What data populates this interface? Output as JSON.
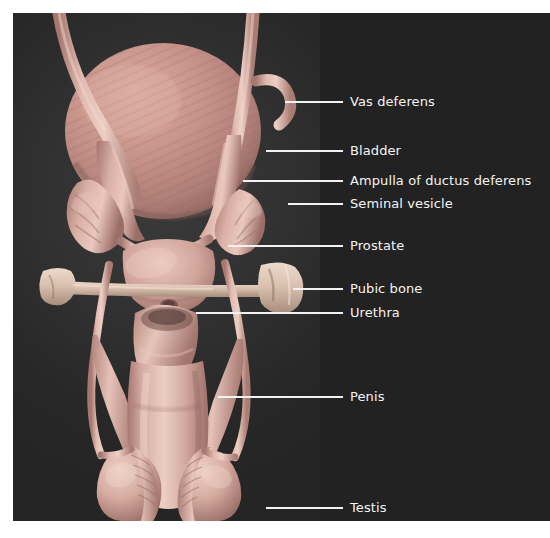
{
  "figure": {
    "background_color": "#ffffff",
    "panel_color": "#232323",
    "stage_color": "#303030",
    "label_panel_color": "#212121",
    "label_text_color": "#f4f4f4",
    "leader_line_color": "#f2f2f2",
    "organ_color": "#c79a92",
    "organ_highlight_color": "#e8c4bb",
    "organ_shadow_color": "#8d645e",
    "bone_color": "#d9c3b4"
  },
  "labels": [
    {
      "id": "vas-deferens",
      "text": "Vas deferens",
      "leader": {
        "x": 272,
        "y": 88,
        "width": 58
      },
      "text_x": 337,
      "text_y": 81
    },
    {
      "id": "bladder",
      "text": "Bladder",
      "leader": {
        "x": 253,
        "y": 137,
        "width": 77
      },
      "text_x": 337,
      "text_y": 130
    },
    {
      "id": "ampulla-of-ductus-deferens",
      "text": "Ampulla of ductus deferens",
      "leader": {
        "x": 230,
        "y": 167,
        "width": 100
      },
      "text_x": 337,
      "text_y": 160
    },
    {
      "id": "seminal-vesicle",
      "text": "Seminal vesicle",
      "leader": {
        "x": 275,
        "y": 190,
        "width": 55
      },
      "text_x": 337,
      "text_y": 183
    },
    {
      "id": "prostate",
      "text": "Prostate",
      "leader": {
        "x": 215,
        "y": 232,
        "width": 115
      },
      "text_x": 337,
      "text_y": 225
    },
    {
      "id": "pubic-bone",
      "text": "Pubic bone",
      "leader": {
        "x": 280,
        "y": 275,
        "width": 50
      },
      "text_x": 337,
      "text_y": 268
    },
    {
      "id": "urethra",
      "text": "Urethra",
      "leader": {
        "x": 183,
        "y": 299,
        "width": 147
      },
      "text_x": 337,
      "text_y": 292
    },
    {
      "id": "penis",
      "text": "Penis",
      "leader": {
        "x": 205,
        "y": 383,
        "width": 125
      },
      "text_x": 337,
      "text_y": 376
    },
    {
      "id": "testis",
      "text": "Testis",
      "leader": {
        "x": 253,
        "y": 494,
        "width": 77
      },
      "text_x": 337,
      "text_y": 487
    }
  ],
  "structures": [
    {
      "id": "bladder",
      "name": "Bladder"
    },
    {
      "id": "vas-deferens-left",
      "name": "Vas deferens (left)"
    },
    {
      "id": "vas-deferens-right",
      "name": "Vas deferens (right)"
    },
    {
      "id": "ampulla-left",
      "name": "Ampulla of ductus deferens (left)"
    },
    {
      "id": "ampulla-right",
      "name": "Ampulla of ductus deferens (right)"
    },
    {
      "id": "seminal-vesicle-left",
      "name": "Seminal vesicle (left)"
    },
    {
      "id": "seminal-vesicle-right",
      "name": "Seminal vesicle (right)"
    },
    {
      "id": "prostate",
      "name": "Prostate"
    },
    {
      "id": "pubic-bone",
      "name": "Pubic bone"
    },
    {
      "id": "urethra",
      "name": "Urethra"
    },
    {
      "id": "penis-shaft",
      "name": "Penis shaft"
    },
    {
      "id": "corpus-cavernosum-left",
      "name": "Corpus cavernosum (left)"
    },
    {
      "id": "corpus-cavernosum-right",
      "name": "Corpus cavernosum (right)"
    },
    {
      "id": "testis-left",
      "name": "Testis (left)"
    },
    {
      "id": "testis-right",
      "name": "Testis (right)"
    },
    {
      "id": "epididymis-left",
      "name": "Epididymis (left)"
    },
    {
      "id": "epididymis-right",
      "name": "Epididymis (right)"
    }
  ]
}
